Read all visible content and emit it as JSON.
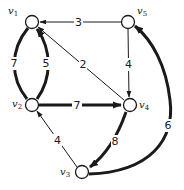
{
  "diagram": {
    "type": "weighted-directed-graph",
    "colors": {
      "ink": "#1a1a1a",
      "background": "#ffffff"
    },
    "nodes": [
      {
        "id": "v1",
        "label": "v",
        "sub": "1",
        "x": 32,
        "y": 22
      },
      {
        "id": "v5",
        "label": "v",
        "sub": "5",
        "x": 128,
        "y": 22
      },
      {
        "id": "v2",
        "label": "v",
        "sub": "2",
        "x": 32,
        "y": 105
      },
      {
        "id": "v4",
        "label": "v",
        "sub": "4",
        "x": 130,
        "y": 105
      },
      {
        "id": "v3",
        "label": "v",
        "sub": "3",
        "x": 82,
        "y": 172
      }
    ],
    "edges": [
      {
        "from": "v5",
        "to": "v1",
        "weight": "3",
        "style": "thin"
      },
      {
        "from": "v4",
        "to": "v1",
        "weight": "2",
        "style": "thin"
      },
      {
        "from": "v5",
        "to": "v4",
        "weight": "4",
        "style": "thin"
      },
      {
        "from": "v1",
        "to": "v2",
        "weight": "7",
        "style": "thick"
      },
      {
        "from": "v2",
        "to": "v1",
        "weight": "5",
        "style": "thick"
      },
      {
        "from": "v2",
        "to": "v4",
        "weight": "7",
        "style": "thick"
      },
      {
        "from": "v4",
        "to": "v3",
        "weight": "8",
        "style": "thick"
      },
      {
        "from": "v3",
        "to": "v5",
        "weight": "6",
        "style": "thick"
      },
      {
        "from": "v3",
        "to": "v2",
        "weight": "4",
        "style": "thin"
      }
    ]
  }
}
